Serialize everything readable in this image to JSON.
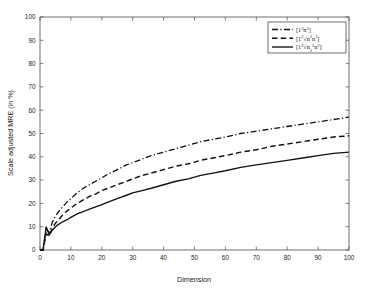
{
  "chart_data": {
    "type": "line",
    "title": "",
    "xlabel": "Dimension",
    "ylabel": "Scale adjusted MRE (in %)",
    "xlim": [
      0,
      100
    ],
    "ylim": [
      0,
      100
    ],
    "xticks": [
      0,
      10,
      20,
      30,
      40,
      50,
      60,
      70,
      80,
      90,
      100
    ],
    "yticks": [
      0,
      10,
      20,
      30,
      40,
      50,
      60,
      70,
      80,
      90,
      100
    ],
    "xticklabels": [
      "0",
      "10",
      "20",
      "30",
      "40",
      "50",
      "60",
      "70",
      "80",
      "90",
      "100"
    ],
    "yticklabels": [
      "0",
      "10",
      "20",
      "30",
      "40",
      "50",
      "60",
      "70",
      "80",
      "90",
      "100"
    ],
    "grid": false,
    "legend_position": "upper right",
    "x": [
      1,
      2,
      3,
      4,
      5,
      6,
      7,
      8,
      9,
      10,
      12,
      14,
      16,
      18,
      20,
      22,
      25,
      28,
      30,
      33,
      36,
      40,
      44,
      48,
      52,
      56,
      60,
      65,
      70,
      75,
      80,
      85,
      90,
      95,
      100
    ],
    "series": [
      {
        "name": "dash-dot",
        "label": "[1²n²]",
        "linestyle": "dash-dot",
        "color": "#111111",
        "values": [
          0,
          9,
          7.5,
          12,
          14.5,
          16.5,
          18,
          19.5,
          21,
          22,
          24.5,
          26.5,
          28,
          29.5,
          31,
          32.5,
          34.5,
          36.5,
          37.5,
          39,
          40.5,
          42,
          43.5,
          45,
          46.5,
          47.5,
          48.5,
          50,
          51,
          52,
          53,
          54,
          55,
          56,
          57
        ]
      },
      {
        "name": "dashed",
        "label": "[1²√n²n²]",
        "linestyle": "dashed",
        "color": "#111111",
        "values": [
          0,
          7,
          6,
          9.5,
          11.5,
          13,
          14.5,
          16,
          17,
          18,
          20,
          21.5,
          23,
          24,
          25.5,
          26.5,
          28,
          29.5,
          30.5,
          32,
          33,
          34.5,
          36,
          37,
          38.5,
          39.5,
          40.5,
          42,
          43,
          44.5,
          45.5,
          46.5,
          47.5,
          48.5,
          49
        ]
      },
      {
        "name": "solid",
        "label": "[1²√n₂²n²]",
        "linestyle": "solid",
        "color": "#111111",
        "values": [
          0,
          10,
          6.5,
          8.5,
          10,
          11,
          11.8,
          12.5,
          13.2,
          14,
          15.5,
          16.5,
          17.5,
          18.5,
          19.5,
          20.5,
          22,
          23.5,
          24.5,
          25.5,
          26.5,
          28,
          29.5,
          30.5,
          32,
          33,
          34,
          35.5,
          36.5,
          37.5,
          38.5,
          39.5,
          40.5,
          41.5,
          42
        ]
      }
    ]
  },
  "legend": {
    "entries": [
      {
        "main_open": "[1",
        "sup1": "2",
        "mid": "n",
        "sup2": "2",
        "close": "]",
        "style": "dash-dot"
      },
      {
        "main_open": "[1",
        "sup1": "2",
        "mid": "√n",
        "sup2": "2",
        "tail": "n",
        "sup3": "2",
        "close": "]",
        "style": "dashed"
      },
      {
        "main_open": "[1",
        "sup1": "2",
        "mid": "√n",
        "sub": "2",
        "sup2": "2",
        "tail": "n",
        "sup3": "2",
        "close": "]",
        "style": "solid"
      }
    ]
  }
}
